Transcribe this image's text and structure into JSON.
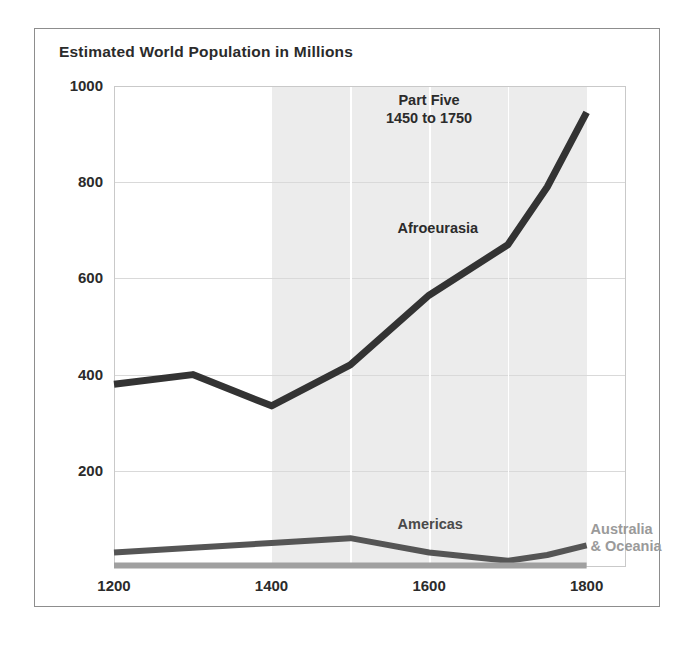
{
  "chart_data": {
    "type": "line",
    "title": "Estimated World Population in Millions",
    "xlabel": "",
    "ylabel": "",
    "xlim": [
      1200,
      1850
    ],
    "ylim": [
      0,
      1000
    ],
    "xticks": [
      "1200",
      "1400",
      "1600",
      "1800"
    ],
    "xtick_values": [
      1200,
      1400,
      1600,
      1800
    ],
    "yticks": [
      "200",
      "400",
      "600",
      "800",
      "1000"
    ],
    "ytick_values": [
      200,
      400,
      600,
      800,
      1000
    ],
    "grid": "horizontal gridlines at each y tick; white vertical gridlines every 100 years inside shaded band",
    "legend_position": "inline labels on series",
    "highlight_band": {
      "label_line1": "Part Five",
      "label_line2": "1450 to 1750",
      "x_start": 1400,
      "x_end": 1800,
      "color": "#ececec"
    },
    "series": [
      {
        "name": "Afroeurasia",
        "color": "#333333",
        "x": [
          1200,
          1300,
          1400,
          1500,
          1600,
          1700,
          1750,
          1800
        ],
        "values": [
          380,
          400,
          335,
          420,
          565,
          670,
          790,
          945
        ]
      },
      {
        "name": "Americas",
        "color": "#555555",
        "x": [
          1200,
          1300,
          1400,
          1500,
          1600,
          1700,
          1750,
          1800
        ],
        "values": [
          30,
          40,
          50,
          60,
          30,
          13,
          25,
          45
        ]
      },
      {
        "name": "Australia & Oceania",
        "color": "#a0a0a0",
        "x": [
          1200,
          1300,
          1400,
          1500,
          1600,
          1700,
          1750,
          1800
        ],
        "values": [
          3,
          3,
          3,
          3,
          3,
          3,
          3,
          3
        ]
      }
    ]
  },
  "labels": {
    "afroeurasia": "Afroeurasia",
    "americas": "Americas",
    "australia_line1": "Australia",
    "australia_line2": "& Oceania"
  },
  "colors": {
    "afroeurasia": "#333333",
    "americas": "#555555",
    "australia": "#a0a0a0",
    "band": "#ececec",
    "grid": "#d9d9d9",
    "frame": "#8d8d8d",
    "text": "#2b2b2b"
  }
}
